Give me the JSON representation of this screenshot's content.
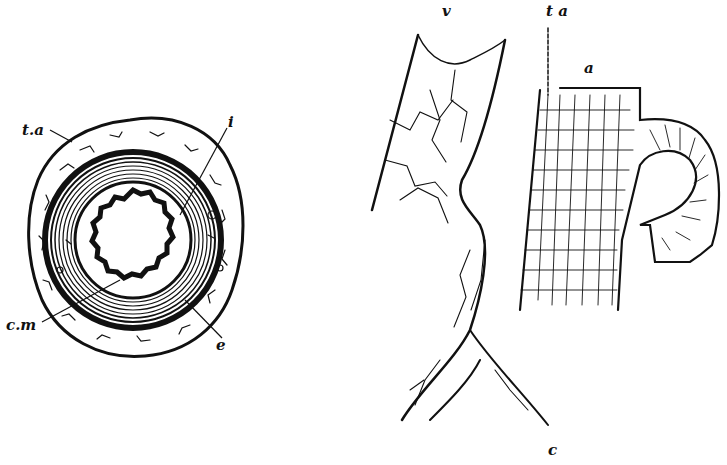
{
  "figure": {
    "left_panel": {
      "name": "transverse-section-of-artery",
      "labels": {
        "tunica_adventitia": "t.a",
        "intima": "i",
        "circular_muscle": "c.m",
        "elastic": "e"
      }
    },
    "right_panel": {
      "name": "vessel-walls",
      "labels": {
        "vein": "v",
        "tunica_adventitia": "t a",
        "artery": "a",
        "capillary": "c"
      }
    }
  },
  "colors": {
    "ink": "#111111",
    "paper": "#ffffff"
  }
}
